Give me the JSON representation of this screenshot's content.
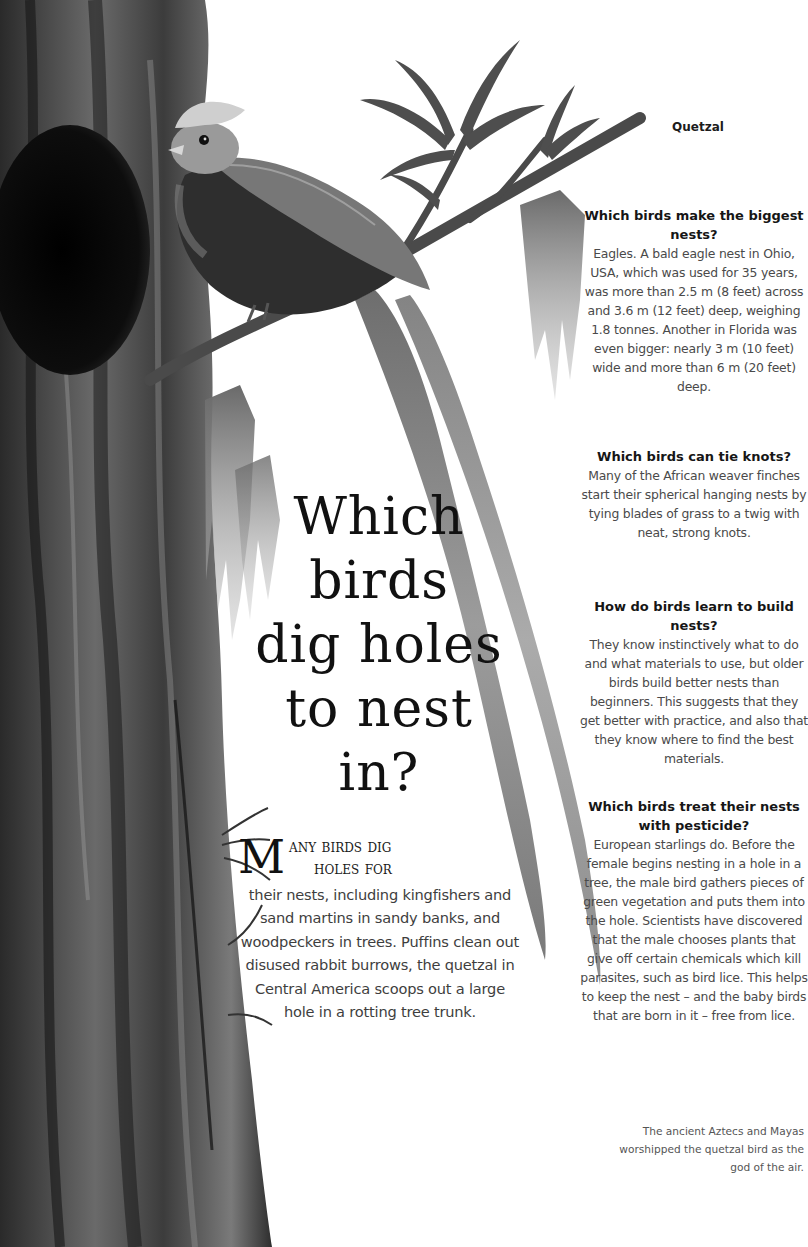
{
  "captions": {
    "top": "Quetzal",
    "bottom": "The ancient Aztecs and Mayas worshipped the quetzal bird as the god of the air."
  },
  "title": "Which birds dig holes to nest in?",
  "title_lines": [
    "Which",
    "birds",
    "dig holes",
    "to nest",
    "in?"
  ],
  "intro": {
    "dropcap": "M",
    "lead_line1": "any birds dig",
    "lead_line2": "holes for",
    "body": "their nests, including kingfishers and sand martins in sandy banks, and woodpeckers in trees. Puffins clean out disused rabbit burrows, the quetzal in Central America scoops out a large hole in a rotting tree trunk."
  },
  "qa": [
    {
      "question": "Which birds make the biggest nests?",
      "answer": "Eagles. A bald eagle nest in Ohio, USA, which was used for 35 years, was more than 2.5 m (8 feet) across and 3.6 m (12 feet) deep, weighing 1.8 tonnes. Another in Florida was even bigger: nearly 3 m (10 feet) wide and more than 6 m (20 feet) deep."
    },
    {
      "question": "Which birds can tie knots?",
      "answer": "Many of the African weaver finches start their spherical hanging nests by tying blades of grass to a twig with neat, strong knots."
    },
    {
      "question": "How do birds learn to build nests?",
      "answer": "They know instinctively what to do and what materials to use, but older birds build better nests than beginners. This suggests that they get better with practice, and also that they know where to find the best materials."
    },
    {
      "question": "Which birds treat their nests with pesticide?",
      "answer": "European starlings do. Before the female begins nesting in a hole in a tree, the male bird gathers pieces of green vegetation and puts them into the hole. Scientists have discovered that the male chooses plants that give off certain chemicals which kill parasites, such as bird lice. This helps to keep the nest – and the baby birds that are born in it – free from lice."
    }
  ],
  "illustration": {
    "subject": "quetzal-perched-on-branch-by-tree-trunk",
    "palette": {
      "trunk_dark": "#1a1a1a",
      "trunk_mid": "#5a5a5a",
      "trunk_light": "#9a9a9a",
      "moss": "#8c8c8c",
      "tail": "#a6a6a6",
      "paper": "#ffffff"
    }
  }
}
